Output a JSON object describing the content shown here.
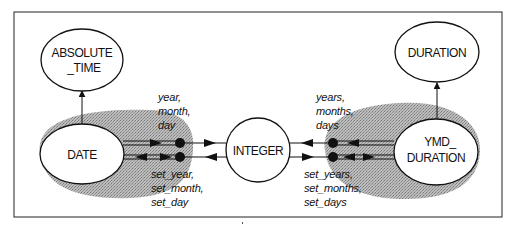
{
  "diagram": {
    "nodes": {
      "absolute_time": [
        "ABSOLUTE",
        "_TIME"
      ],
      "duration": [
        "DURATION"
      ],
      "date": [
        "DATE"
      ],
      "integer": [
        "INTEGER"
      ],
      "ymd_duration": [
        "YMD_",
        "DURATION"
      ]
    },
    "function_groups": {
      "date_getters": [
        "year,",
        "month,",
        "day"
      ],
      "date_setters": [
        "set_year,",
        "set_month,",
        "set_day"
      ],
      "ymd_getters": [
        "years,",
        "months,",
        "days"
      ],
      "ymd_setters": [
        "set_years,",
        "set_months,",
        "set_days"
      ]
    },
    "edges": [
      {
        "from": "DATE",
        "to": "ABSOLUTE_TIME",
        "kind": "inheritance"
      },
      {
        "from": "YMD_DURATION",
        "to": "DURATION",
        "kind": "inheritance"
      },
      {
        "from": "DATE",
        "via": "year, month, day",
        "to": "INTEGER",
        "kind": "query"
      },
      {
        "from": "INTEGER",
        "via": "set_year, set_month, set_day",
        "to": "DATE",
        "kind": "command"
      },
      {
        "from": "YMD_DURATION",
        "via": "years, months, days",
        "to": "INTEGER",
        "kind": "query"
      },
      {
        "from": "INTEGER",
        "via": "set_years, set_months, set_days",
        "to": "YMD_DURATION",
        "kind": "command"
      }
    ],
    "colors": {
      "ink": "#111111",
      "shade": "#a9a9a9",
      "background": "#ffffff"
    }
  }
}
